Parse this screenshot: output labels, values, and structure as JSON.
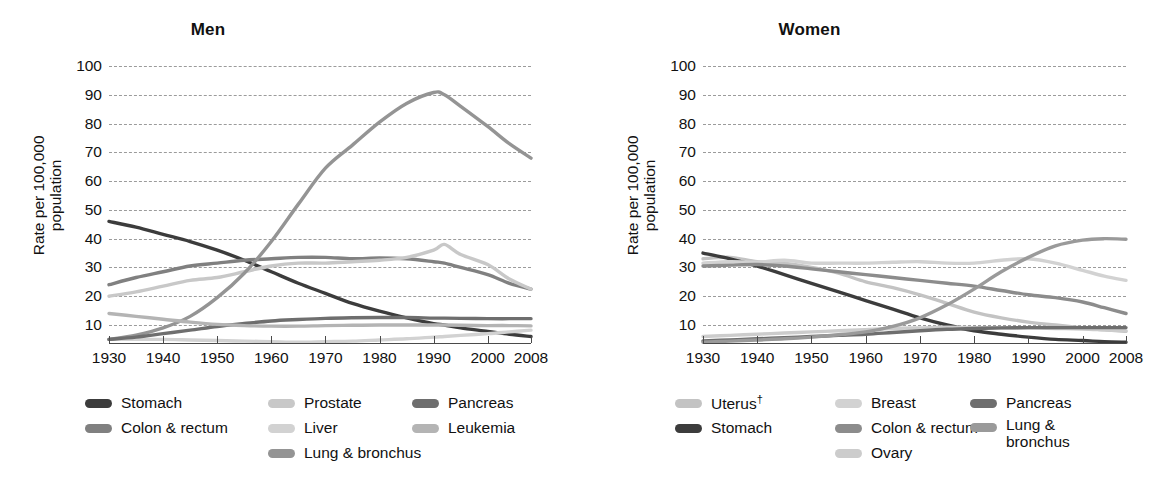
{
  "chart_data": [
    {
      "type": "line",
      "title": "Men",
      "xlabel": "",
      "ylabel": "Rate per 100,000 population",
      "xlim": [
        1930,
        2008
      ],
      "ylim": [
        0,
        100
      ],
      "yticks": [
        10,
        20,
        30,
        40,
        50,
        60,
        70,
        80,
        90,
        100
      ],
      "xticks": [
        1930,
        1940,
        1950,
        1960,
        1970,
        1980,
        1990,
        2000,
        2008
      ],
      "xtick_labels": [
        "1930",
        "1940",
        "1950",
        "1960",
        "1970",
        "1980",
        "1990",
        "2000",
        "2008"
      ],
      "grid": true,
      "legend_position": "bottom",
      "x": [
        1930,
        1935,
        1940,
        1945,
        1950,
        1955,
        1960,
        1965,
        1970,
        1975,
        1980,
        1985,
        1990,
        1992,
        1995,
        2000,
        2004,
        2008
      ],
      "series": [
        {
          "name": "Stomach",
          "color": "#3c3c3c",
          "values": [
            46.0,
            44.0,
            41.5,
            39.0,
            36.0,
            32.5,
            28.5,
            24.5,
            21.0,
            17.5,
            14.8,
            12.5,
            10.5,
            10.0,
            9.0,
            7.8,
            6.8,
            6.0
          ]
        },
        {
          "name": "Colon & rectum",
          "color": "#808080",
          "values": [
            24.0,
            26.5,
            28.5,
            30.5,
            31.5,
            32.5,
            33.0,
            33.5,
            33.5,
            33.0,
            33.3,
            33.0,
            32.0,
            31.5,
            30.0,
            27.5,
            24.5,
            22.5
          ]
        },
        {
          "name": "Prostate",
          "color": "#c8c8c8",
          "values": [
            20.0,
            21.5,
            23.5,
            25.5,
            26.5,
            28.5,
            30.5,
            31.5,
            31.5,
            32.0,
            32.5,
            33.5,
            36.0,
            38.0,
            34.5,
            31.0,
            26.0,
            22.5
          ]
        },
        {
          "name": "Liver",
          "color": "#d2d2d2",
          "values": [
            5.0,
            5.0,
            5.0,
            4.8,
            4.6,
            4.4,
            4.2,
            4.0,
            4.2,
            4.4,
            4.8,
            5.2,
            5.8,
            6.0,
            6.4,
            7.0,
            7.6,
            8.2
          ]
        },
        {
          "name": "Lung & bronchus",
          "color": "#949494",
          "values": [
            5.0,
            6.5,
            9.0,
            13.0,
            19.5,
            28.0,
            39.0,
            52.0,
            64.5,
            72.5,
            80.5,
            87.0,
            90.8,
            90.0,
            86.0,
            79.0,
            73.0,
            68.0
          ]
        },
        {
          "name": "Pancreas",
          "color": "#6e6e6e",
          "values": [
            5.0,
            5.8,
            7.0,
            8.2,
            9.5,
            10.5,
            11.4,
            11.9,
            12.3,
            12.5,
            12.6,
            12.6,
            12.4,
            12.4,
            12.3,
            12.2,
            12.2,
            12.2
          ]
        },
        {
          "name": "Leukemia",
          "color": "#b4b4b4",
          "values": [
            14.0,
            13.0,
            12.0,
            11.0,
            10.2,
            9.8,
            9.6,
            9.6,
            9.8,
            9.9,
            10.0,
            10.0,
            10.0,
            10.0,
            9.9,
            9.8,
            9.8,
            9.7
          ]
        }
      ]
    },
    {
      "type": "line",
      "title": "Women",
      "xlabel": "",
      "ylabel": "Rate per 100,000 population",
      "xlim": [
        1930,
        2008
      ],
      "ylim": [
        0,
        100
      ],
      "yticks": [
        10,
        20,
        30,
        40,
        50,
        60,
        70,
        80,
        90,
        100
      ],
      "xticks": [
        1930,
        1940,
        1950,
        1960,
        1970,
        1980,
        1990,
        2000,
        2008
      ],
      "xtick_labels": [
        "1930",
        "1940",
        "1950",
        "1960",
        "1970",
        "1980",
        "1990",
        "2000",
        "2008"
      ],
      "grid": true,
      "legend_position": "bottom",
      "x": [
        1930,
        1935,
        1940,
        1945,
        1950,
        1955,
        1960,
        1965,
        1970,
        1975,
        1980,
        1985,
        1990,
        1995,
        2000,
        2004,
        2008
      ],
      "series": [
        {
          "name": "Uterus",
          "color": "#c3c3c3",
          "values": [
            33.0,
            33.5,
            32.0,
            31.5,
            30.0,
            28.0,
            25.0,
            23.0,
            20.5,
            17.5,
            14.5,
            12.5,
            11.0,
            10.0,
            9.0,
            8.3,
            7.8
          ]
        },
        {
          "name": "Stomach",
          "color": "#3c3c3c",
          "values": [
            35.0,
            33.0,
            30.5,
            27.5,
            24.5,
            21.5,
            18.5,
            15.5,
            12.5,
            10.0,
            8.0,
            6.8,
            5.8,
            5.0,
            4.6,
            4.2,
            4.0
          ]
        },
        {
          "name": "Breast",
          "color": "#d2d2d2",
          "values": [
            31.5,
            32.0,
            31.8,
            32.5,
            31.5,
            31.5,
            31.5,
            31.8,
            32.0,
            31.5,
            31.5,
            32.5,
            33.0,
            31.5,
            29.0,
            27.0,
            25.5
          ]
        },
        {
          "name": "Colon & rectum",
          "color": "#8c8c8c",
          "values": [
            30.5,
            30.8,
            31.0,
            30.5,
            29.5,
            28.5,
            27.5,
            26.5,
            25.5,
            24.5,
            23.5,
            22.0,
            20.5,
            19.5,
            18.0,
            16.0,
            14.0
          ]
        },
        {
          "name": "Ovary",
          "color": "#cccccc",
          "values": [
            6.0,
            6.4,
            6.8,
            7.2,
            7.6,
            8.0,
            8.4,
            8.8,
            9.0,
            9.2,
            9.1,
            9.0,
            9.0,
            8.8,
            8.6,
            8.3,
            8.0
          ]
        },
        {
          "name": "Pancreas",
          "color": "#6e6e6e",
          "values": [
            4.5,
            4.8,
            5.2,
            5.6,
            6.0,
            6.4,
            6.8,
            7.4,
            8.0,
            8.5,
            8.8,
            9.0,
            9.1,
            9.1,
            9.1,
            9.1,
            9.1
          ]
        },
        {
          "name": "Lung & bronchus",
          "color": "#9a9a9a",
          "values": [
            4.0,
            4.4,
            4.8,
            5.2,
            5.8,
            6.6,
            7.6,
            9.5,
            12.5,
            17.0,
            22.5,
            28.5,
            33.5,
            37.5,
            39.5,
            40.0,
            39.8
          ]
        }
      ]
    }
  ],
  "men": {
    "title": "Men",
    "ylabel_line1": "Rate per 100,000",
    "ylabel_line2": "population",
    "yticks": [
      "100",
      "90",
      "80",
      "70",
      "60",
      "50",
      "40",
      "30",
      "20",
      "10"
    ],
    "xticks": [
      "1930",
      "1940",
      "1950",
      "1960",
      "1970",
      "1980",
      "1990",
      "2000",
      "2008"
    ],
    "legend": {
      "col1": [
        {
          "label": "Stomach",
          "color": "#3c3c3c"
        },
        {
          "label": "Colon & rectum",
          "color": "#808080"
        }
      ],
      "col2": [
        {
          "label": "Prostate",
          "color": "#c8c8c8"
        },
        {
          "label": "Liver",
          "color": "#d2d2d2"
        },
        {
          "label": "Lung & bronchus",
          "color": "#949494"
        }
      ],
      "col3": [
        {
          "label": "Pancreas",
          "color": "#6e6e6e"
        },
        {
          "label": "Leukemia",
          "color": "#b4b4b4"
        }
      ]
    }
  },
  "women": {
    "title": "Women",
    "ylabel_line1": "Rate per 100,000",
    "ylabel_line2": "population",
    "yticks": [
      "100",
      "90",
      "80",
      "70",
      "60",
      "50",
      "40",
      "30",
      "20",
      "10"
    ],
    "xticks": [
      "1930",
      "1940",
      "1950",
      "1960",
      "1970",
      "1980",
      "1990",
      "2000",
      "2008"
    ],
    "legend": {
      "col1": [
        {
          "label": "Uterus",
          "dagger": "†",
          "color": "#c3c3c3"
        },
        {
          "label": "Stomach",
          "color": "#3c3c3c"
        }
      ],
      "col2": [
        {
          "label": "Breast",
          "color": "#d2d2d2"
        },
        {
          "label": "Colon & rectum",
          "color": "#8c8c8c"
        },
        {
          "label": "Ovary",
          "color": "#cccccc"
        }
      ],
      "col3": [
        {
          "label": "Pancreas",
          "color": "#6e6e6e"
        },
        {
          "label": "Lung & bronchus",
          "color": "#9a9a9a",
          "wrap": true
        }
      ]
    }
  },
  "style": {
    "grid_color": "#9b9b9b",
    "axis_color": "#4a4a4a",
    "text_color": "#111111",
    "background": "#ffffff"
  }
}
